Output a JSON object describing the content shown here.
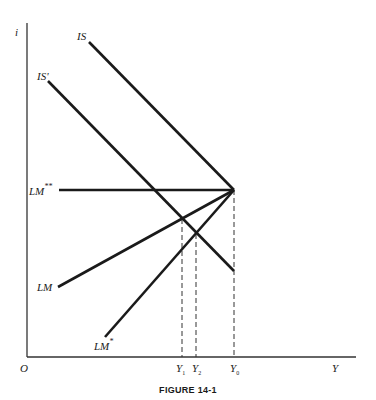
{
  "figure": {
    "caption": "FIGURE 14-1",
    "axes": {
      "y_label": "i",
      "x_label": "Y",
      "origin_label": "O"
    },
    "curves": {
      "is": "IS",
      "is_prime": "IS'",
      "lm": "LM",
      "lm_star": "LM",
      "lm_star_sup": "*",
      "lm_dstar": "LM",
      "lm_dstar_sup": "**"
    },
    "x_ticks": {
      "y1": "Y",
      "y1_sub": "1",
      "y2": "Y",
      "y2_sub": "2",
      "y0": "Y",
      "y0_sub": "0"
    },
    "colors": {
      "ink": "#1a1a1a",
      "axis": "#333333",
      "background": "#ffffff"
    }
  }
}
